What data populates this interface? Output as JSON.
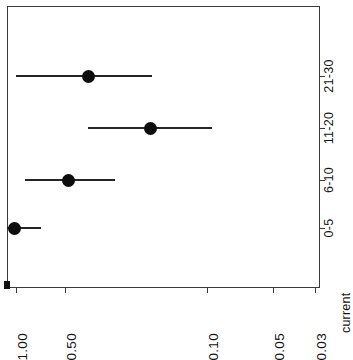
{
  "chart_data": {
    "type": "scatter",
    "title": "",
    "subtitle": "",
    "orientation": "rotated-90-ccw",
    "xlabel": "",
    "ylabel": "current",
    "categories": [
      "0-5",
      "6-10",
      "11-20",
      "21-30"
    ],
    "values": [
      1.0,
      0.48,
      0.22,
      0.42
    ],
    "error_low": [
      1.0,
      0.7,
      0.38,
      0.83
    ],
    "error_high": [
      0.62,
      0.3,
      0.115,
      0.175
    ],
    "scale": "log",
    "value_ticks": [
      1.0,
      0.5,
      0.1,
      0.05,
      0.03
    ],
    "value_tick_labels": [
      "1.00",
      "0.50",
      "0.10",
      "0.05",
      "0.03"
    ],
    "ylim": [
      1.0,
      0.03
    ],
    "grid": false,
    "legend": null,
    "series": [
      {
        "name": "current",
        "points": [
          {
            "category": "0-5",
            "value": 1.0,
            "low": 1.0,
            "high": 0.62
          },
          {
            "category": "6-10",
            "value": 0.48,
            "low": 0.7,
            "high": 0.3
          },
          {
            "category": "11-20",
            "value": 0.22,
            "low": 0.38,
            "high": 0.115
          },
          {
            "category": "21-30",
            "value": 0.42,
            "low": 0.83,
            "high": 0.175
          }
        ]
      }
    ]
  },
  "axes": {
    "value_axis": {
      "title": "current",
      "ticks": [
        {
          "label": "1.00",
          "pos": 16
        },
        {
          "label": "0.50",
          "pos": 65
        },
        {
          "label": "0.10",
          "pos": 207
        },
        {
          "label": "0.05",
          "pos": 273
        },
        {
          "label": "0.03",
          "pos": 315
        }
      ]
    },
    "category_axis": {
      "ticks": [
        {
          "label": "21-30",
          "pos": 76
        },
        {
          "label": "11-20",
          "pos": 128
        },
        {
          "label": "6-10",
          "pos": 180
        },
        {
          "label": "0-5",
          "pos": 228
        }
      ]
    }
  },
  "marks": [
    {
      "name": "21-30",
      "center": 88,
      "left": 16,
      "right": 152,
      "row": 76
    },
    {
      "name": "11-20",
      "center": 150,
      "left": 88,
      "right": 212,
      "row": 128
    },
    {
      "name": "6-10",
      "center": 68,
      "left": 25,
      "right": 115,
      "row": 180
    },
    {
      "name": "0-5",
      "center": 14,
      "left": 2,
      "right": 41,
      "row": 228
    }
  ],
  "colors": {
    "marker": "#0d0d0d",
    "errorbar": "#262626",
    "frame": "#3a3a3a",
    "text": "#141414",
    "background": "#ffffff"
  }
}
